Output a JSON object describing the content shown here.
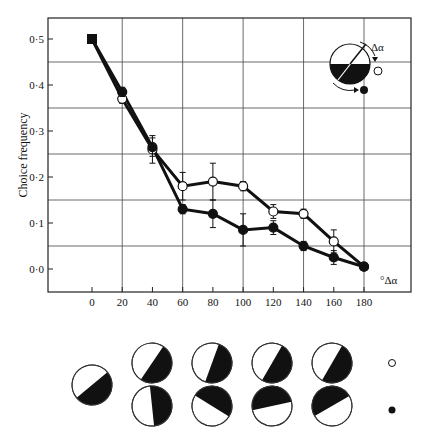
{
  "chart_data": {
    "type": "line",
    "title": "",
    "xlabel": "°Δα",
    "ylabel": "Choice frequency",
    "x": [
      0,
      20,
      40,
      60,
      80,
      100,
      120,
      140,
      160,
      180
    ],
    "xlim": [
      -25,
      210
    ],
    "ylim": [
      -0.05,
      0.55
    ],
    "x_ticks": [
      "0",
      "20",
      "40",
      "60",
      "80",
      "100",
      "120",
      "140",
      "160",
      "180"
    ],
    "y_ticks": [
      "0·0",
      "0·1",
      "0·2",
      "0·3",
      "0·4",
      "0·5"
    ],
    "grid": true,
    "series": [
      {
        "name": "open circles (rotation in direction of arrow to open circle)",
        "marker": "open-circle",
        "values": [
          0.5,
          0.37,
          0.26,
          0.18,
          0.19,
          0.18,
          0.125,
          0.12,
          0.06,
          0.005
        ],
        "errors": [
          0,
          0.01,
          0.03,
          0.03,
          0.04,
          0.01,
          0.015,
          0.01,
          0.025,
          0.005
        ]
      },
      {
        "name": "filled circles (rotation in direction of arrow to filled circle)",
        "marker": "filled-circle",
        "values": [
          0.5,
          0.385,
          0.265,
          0.13,
          0.12,
          0.085,
          0.09,
          0.05,
          0.025,
          0.005
        ],
        "errors": [
          0,
          0.01,
          0.02,
          0.01,
          0.03,
          0.035,
          0.015,
          0.01,
          0.015,
          0.005
        ]
      }
    ],
    "start_marker": "filled-square at (0, 0.5)",
    "inset_label": "Δα",
    "annotations": [
      "inset: half-black disk with rotation arrows to open and filled circles"
    ]
  },
  "patterns": {
    "reference_angle": 40,
    "open_row_angles": [
      0,
      20,
      60,
      100,
      140
    ],
    "filled_row_angles": [
      0,
      -20,
      -60,
      -100,
      -140
    ],
    "legend_open": "○",
    "legend_filled": "●"
  }
}
